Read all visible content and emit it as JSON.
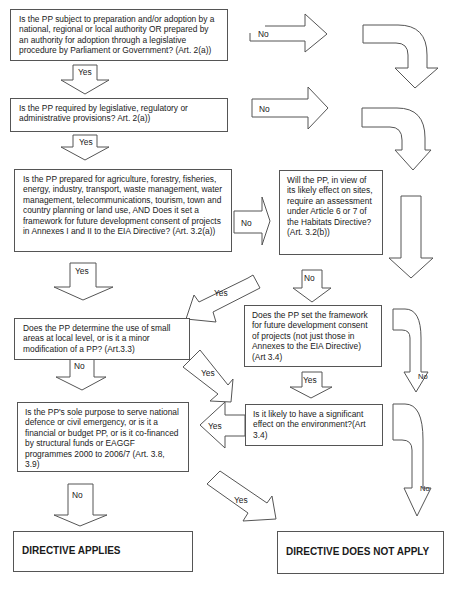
{
  "diagram": {
    "type": "flowchart",
    "questions": [
      {
        "id": "q1",
        "text": "Is the PP subject to preparation and/or adoption by a national, regional or local authority OR prepared by an authority for adoption through a legislative procedure by Parliament or Government? (Art. 2(a))"
      },
      {
        "id": "q2",
        "text": "Is the PP required by legislative, regulatory or administrative provisions? Art. 2(a))"
      },
      {
        "id": "q3",
        "text": "Is the PP prepared for agriculture, forestry, fisheries, energy, industry, transport, waste management, water management, telecommunications, tourism, town and country planning or land use, AND Does it set a framework for future development consent of projects in Annexes I and II to the EIA Directive? (Art. 3.2(a))"
      },
      {
        "id": "q4",
        "text": "Will the PP, in view of its  likely effect on sites, require an assessment under Article 6 or 7 of the Habitats Directive?(Art. 3.2(b))"
      },
      {
        "id": "q5",
        "text": "Does the PP determine the use of small areas at local level, or is it a minor modification of a PP? (Art.3.3)"
      },
      {
        "id": "q6",
        "text": "Does the PP set the framework for future development consent of projects (not just those in Annexes to the EIA Directive) (Art 3.4)"
      },
      {
        "id": "q7",
        "text": "Is it likely to have a significant effect on the environment?(Art 3.4)"
      },
      {
        "id": "q8",
        "text": "Is the PP's sole purpose to serve national defence or civil emergency, or is it a financial or budget PP, or is it co-financed by structural funds or EAGGF programmes 2000 to 2006/7 (Art. 3.8, 3.9)"
      }
    ],
    "outcomes": [
      {
        "id": "applies",
        "text": "DIRECTIVE APPLIES"
      },
      {
        "id": "not_applies",
        "text": "DIRECTIVE DOES NOT APPLY"
      }
    ],
    "arrow_labels": {
      "q1_no": "No",
      "q1_yes": "Yes",
      "q2_no": "No",
      "q2_yes": "Yes",
      "q3_yes": "Yes",
      "q3_no": "No",
      "q4_yes": "Yes",
      "q4_no": "No",
      "q5_yes": "Yes",
      "q5_no": "No",
      "q6_yes": "Yes",
      "q6_no": "No",
      "q7_yes": "Yes",
      "q7_no": "No",
      "q8_yes": "Yes",
      "q8_no": "No"
    },
    "edges": [
      {
        "from": "q1",
        "to": "not_applies",
        "label": "No"
      },
      {
        "from": "q1",
        "to": "q2",
        "label": "Yes"
      },
      {
        "from": "q2",
        "to": "not_applies",
        "label": "No"
      },
      {
        "from": "q2",
        "to": "q3",
        "label": "Yes"
      },
      {
        "from": "q3",
        "to": "q5",
        "label": "Yes"
      },
      {
        "from": "q3",
        "to": "q4",
        "label": "No"
      },
      {
        "from": "q4",
        "to": "q5",
        "label": "Yes"
      },
      {
        "from": "q4",
        "to": "q6",
        "label": "No"
      },
      {
        "from": "q5",
        "to": "q8",
        "label": "No"
      },
      {
        "from": "q5",
        "to": "q7",
        "label": "Yes"
      },
      {
        "from": "q6",
        "to": "q7",
        "label": "Yes"
      },
      {
        "from": "q6",
        "to": "not_applies",
        "label": "No"
      },
      {
        "from": "q7",
        "to": "q8",
        "label": "Yes"
      },
      {
        "from": "q7",
        "to": "not_applies",
        "label": "No"
      },
      {
        "from": "q8",
        "to": "applies",
        "label": "No"
      },
      {
        "from": "q8",
        "to": "not_applies",
        "label": "Yes"
      }
    ]
  }
}
